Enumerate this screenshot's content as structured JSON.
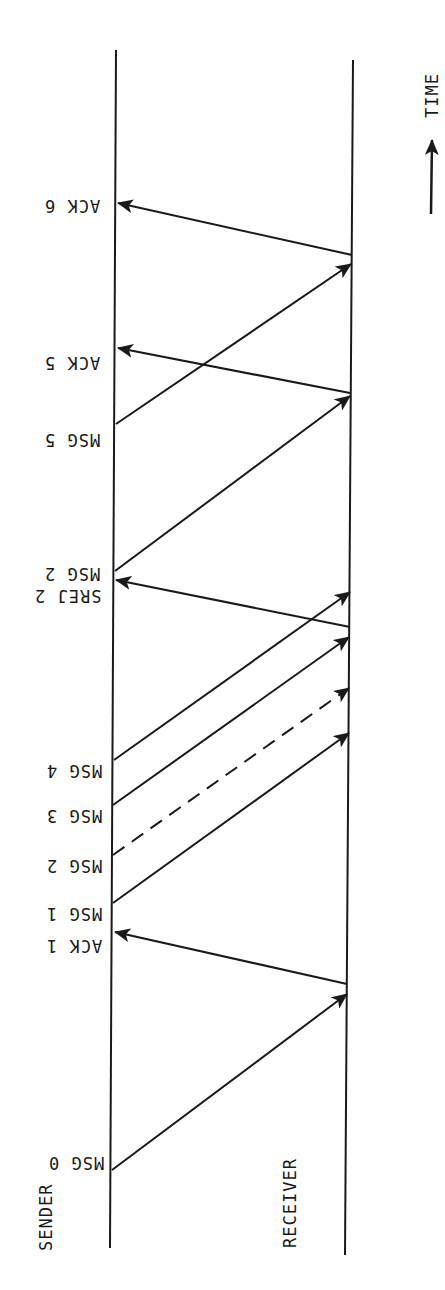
{
  "diagram": {
    "title_axis": "TIME",
    "participants": {
      "sender": "SENDER",
      "receiver": "RECEIVER"
    },
    "labels": {
      "ack6": "ACK 6",
      "ack5": "ACK 5",
      "msg5": "MSG 5",
      "msg2_retx": "MSG 2",
      "srej2": "SREJ 2",
      "msg4": "MSG 4",
      "msg3": "MSG 3",
      "msg2": "MSG 2",
      "msg1": "MSG 1",
      "ack1": "ACK 1",
      "msg0": "MSG 0"
    },
    "messages": [
      {
        "label": "MSG 0",
        "from": "SENDER",
        "to": "RECEIVER",
        "style": "solid"
      },
      {
        "label": "ACK 1",
        "from": "RECEIVER",
        "to": "SENDER",
        "style": "solid"
      },
      {
        "label": "MSG 1",
        "from": "SENDER",
        "to": "RECEIVER",
        "style": "solid"
      },
      {
        "label": "MSG 2",
        "from": "SENDER",
        "to": "RECEIVER",
        "style": "dashed",
        "note": "lost"
      },
      {
        "label": "MSG 3",
        "from": "SENDER",
        "to": "RECEIVER",
        "style": "solid"
      },
      {
        "label": "MSG 4",
        "from": "SENDER",
        "to": "RECEIVER",
        "style": "solid"
      },
      {
        "label": "SREJ 2",
        "from": "RECEIVER",
        "to": "SENDER",
        "style": "solid"
      },
      {
        "label": "MSG 2",
        "from": "SENDER",
        "to": "RECEIVER",
        "style": "solid"
      },
      {
        "label": "ACK 5",
        "from": "RECEIVER",
        "to": "SENDER",
        "style": "solid"
      },
      {
        "label": "MSG 5",
        "from": "SENDER",
        "to": "RECEIVER",
        "style": "solid"
      },
      {
        "label": "ACK 6",
        "from": "RECEIVER",
        "to": "SENDER",
        "style": "solid"
      }
    ],
    "colors": {
      "ink": "#1a1a1a",
      "background": "#ffffff"
    }
  }
}
